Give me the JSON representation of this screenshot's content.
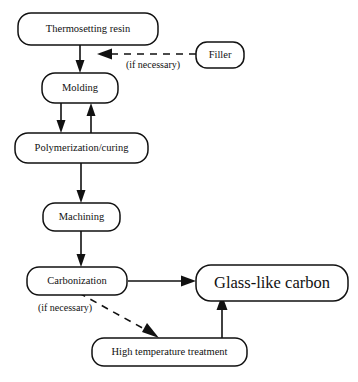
{
  "figure": {
    "type": "process-flowchart",
    "background_color": "#ffffff",
    "line_color": "#111111"
  },
  "nodes": {
    "thermosetting_resin": {
      "label": "Thermosetting resin"
    },
    "filler": {
      "label": "Filler"
    },
    "molding": {
      "label": "Molding"
    },
    "polymerization": {
      "label": "Polymerization/curing"
    },
    "machining": {
      "label": "Machining"
    },
    "carbonization": {
      "label": "Carbonization"
    },
    "high_temperature_treatment": {
      "label": "High temperature treatment"
    },
    "glass_like_carbon": {
      "label": "Glass-like carbon"
    }
  },
  "edge_notes": {
    "filler_note": "(if necessary)",
    "high_temperature_note": "(if necessary)"
  },
  "edges": [
    {
      "from": "thermosetting_resin",
      "to": "molding",
      "style": "solid"
    },
    {
      "from": "filler",
      "to": "molding",
      "style": "dashed",
      "note": "(if necessary)"
    },
    {
      "from": "molding",
      "to": "polymerization",
      "style": "solid"
    },
    {
      "from": "polymerization",
      "to": "molding",
      "style": "solid"
    },
    {
      "from": "polymerization",
      "to": "machining",
      "style": "solid"
    },
    {
      "from": "machining",
      "to": "carbonization",
      "style": "solid"
    },
    {
      "from": "carbonization",
      "to": "glass_like_carbon",
      "style": "solid"
    },
    {
      "from": "carbonization",
      "to": "high_temperature_treatment",
      "style": "dashed",
      "note": "(if necessary)"
    },
    {
      "from": "high_temperature_treatment",
      "to": "glass_like_carbon",
      "style": "solid"
    }
  ]
}
